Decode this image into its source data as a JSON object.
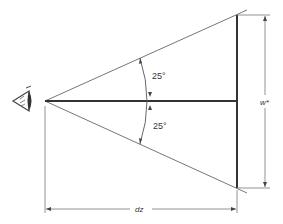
{
  "diagram": {
    "title": "",
    "angles": {
      "upper_label": "25°",
      "lower_label": "25°"
    },
    "dimensions": {
      "width_label": "w*",
      "distance_label": "dz"
    },
    "icons": {
      "viewer": "eye-icon"
    },
    "colors": {
      "line": "#555555",
      "thick_line": "#333333",
      "background": "#ffffff"
    }
  }
}
